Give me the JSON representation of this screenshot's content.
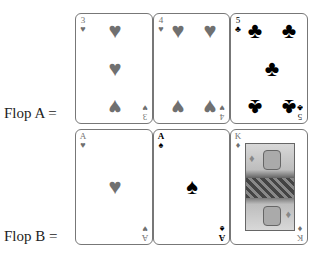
{
  "flops": [
    {
      "label": "Flop A =",
      "cards": [
        {
          "rank": "3",
          "suit": "heart",
          "suit_glyph": "♥",
          "color": "#707070"
        },
        {
          "rank": "4",
          "suit": "heart",
          "suit_glyph": "♥",
          "color": "#707070"
        },
        {
          "rank": "5",
          "suit": "club",
          "suit_glyph": "♣",
          "color": "#000000"
        }
      ]
    },
    {
      "label": "Flop B =",
      "cards": [
        {
          "rank": "A",
          "suit": "heart",
          "suit_glyph": "♥",
          "color": "#707070"
        },
        {
          "rank": "A",
          "suit": "spade",
          "suit_glyph": "♠",
          "color": "#000000"
        },
        {
          "rank": "K",
          "suit": "diamond",
          "suit_glyph": "♦",
          "color": "#707070"
        }
      ]
    }
  ]
}
